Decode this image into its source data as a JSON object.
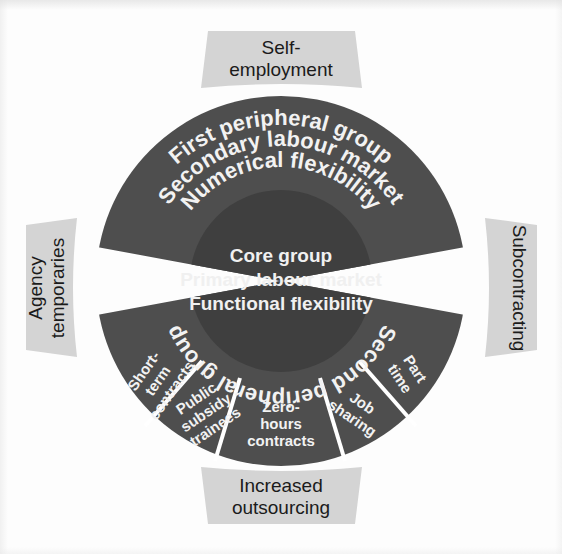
{
  "diagram": {
    "title_semantic": "flexible-firm-model",
    "colors": {
      "background": "#fdfdfd",
      "outer_ring": "#4e4e4e",
      "core_circle": "#3f3f3f",
      "outside_label_band": "#d4d4d4",
      "ring_text": "#f2f2f2",
      "outside_label_text": "#1b1b1b",
      "divider": "#ffffff"
    },
    "core": {
      "lines": [
        "Core group",
        "Primary labour market",
        "Functional flexibility"
      ]
    },
    "first_peripheral": {
      "lines": [
        "First peripheral group",
        "Secondary labour market",
        "Numerical flexibility"
      ]
    },
    "second_peripheral": {
      "label": "Second peripheral group",
      "segments": [
        {
          "id": "short-term-contracts",
          "lines": [
            "Short-",
            "term",
            "contracts"
          ]
        },
        {
          "id": "public-subsidy-trainees",
          "lines": [
            "Public",
            "subsidy",
            "trainees"
          ]
        },
        {
          "id": "zero-hours-contracts",
          "lines": [
            "Zero-",
            "hours",
            "contracts"
          ]
        },
        {
          "id": "job-sharing",
          "lines": [
            "Job",
            "sharing"
          ]
        },
        {
          "id": "part-time",
          "lines": [
            "Part",
            "time"
          ]
        }
      ]
    },
    "outside_labels": {
      "top": {
        "id": "self-employment",
        "lines": [
          "Self-",
          "employment"
        ]
      },
      "right": {
        "id": "subcontracting",
        "lines": [
          "Subcontracting"
        ]
      },
      "bottom": {
        "id": "increased-outsourcing",
        "lines": [
          "Increased",
          "outsourcing"
        ]
      },
      "left": {
        "id": "agency-temporaries",
        "lines": [
          "Agency",
          "temporaries"
        ]
      }
    }
  }
}
